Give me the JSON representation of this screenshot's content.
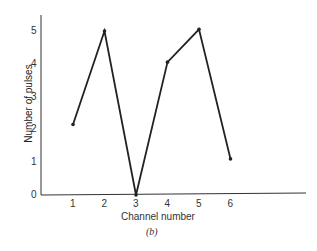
{
  "chart_data": {
    "type": "line",
    "title": "",
    "caption": "(b)",
    "xlabel": "Channel number",
    "ylabel": "Number of pulses",
    "x": [
      1,
      2,
      3,
      4,
      5,
      6
    ],
    "values": [
      2.15,
      5.0,
      0.0,
      4.05,
      5.05,
      1.1
    ],
    "xticks": [
      "1",
      "2",
      "3",
      "4",
      "5",
      "6"
    ],
    "yticks": [
      "0",
      "1",
      "2",
      "3",
      "4",
      "5"
    ],
    "ylim": [
      0,
      5.5
    ],
    "xlim": [
      0,
      9
    ],
    "grid": false,
    "legend": null
  }
}
